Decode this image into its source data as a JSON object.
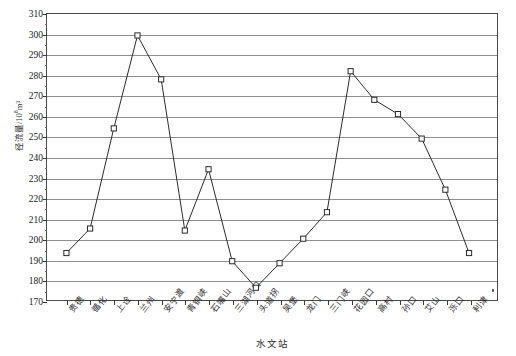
{
  "chart_data": {
    "type": "line",
    "title": "",
    "xlabel": "水文站",
    "ylabel": "径流量/10⁸m³",
    "ylabel_base": "径流量/10",
    "ylabel_sup": "8",
    "ylabel_tail": "m³",
    "ylim": [
      170,
      310
    ],
    "ystep": 10,
    "grid": true,
    "legend": "none",
    "marker": "open-square",
    "line_color": "#2a2a2a",
    "grid_color": "#8f8f8f",
    "axis_color": "#4a4a4a",
    "ytick_labels": [
      "310",
      "300",
      "290",
      "280",
      "270",
      "260",
      "250",
      "240",
      "230",
      "220",
      "210",
      "200",
      "190",
      "180",
      "170"
    ],
    "categories": [
      "贵德",
      "循化",
      "上诠",
      "兰州",
      "安宁渡",
      "青铜峡",
      "石嘴山",
      "三湖河口",
      "头道拐",
      "吴堡",
      "龙门",
      "三门峡",
      "花园口",
      "高村",
      "孙口",
      "艾山",
      "泺口",
      "利津"
    ],
    "values": [
      193,
      205,
      254,
      299.5,
      278,
      204,
      234,
      189,
      176,
      188,
      200,
      213,
      282,
      268,
      261,
      249,
      224,
      193
    ],
    "series": [
      {
        "name": "径流量",
        "values": [
          193,
          205,
          254,
          299.5,
          278,
          204,
          234,
          189,
          176,
          188,
          200,
          213,
          282,
          268,
          261,
          249,
          224,
          193
        ]
      }
    ]
  }
}
